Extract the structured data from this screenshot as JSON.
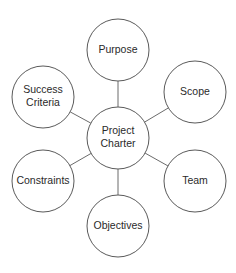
{
  "diagram": {
    "type": "hub-and-spoke",
    "center": {
      "id": "project-charter",
      "label_lines": [
        "Project",
        "Charter"
      ],
      "cx": 118,
      "cy": 138,
      "r": 31
    },
    "nodes": [
      {
        "id": "purpose",
        "label_lines": [
          "Purpose"
        ],
        "cx": 118,
        "cy": 50,
        "r": 31
      },
      {
        "id": "scope",
        "label_lines": [
          "Scope"
        ],
        "cx": 195,
        "cy": 92,
        "r": 31
      },
      {
        "id": "team",
        "label_lines": [
          "Team"
        ],
        "cx": 195,
        "cy": 181,
        "r": 31
      },
      {
        "id": "objectives",
        "label_lines": [
          "Objectives"
        ],
        "cx": 118,
        "cy": 226,
        "r": 31
      },
      {
        "id": "constraints",
        "label_lines": [
          "Constraints"
        ],
        "cx": 43,
        "cy": 181,
        "r": 31
      },
      {
        "id": "success-criteria",
        "label_lines": [
          "Success",
          "Criteria"
        ],
        "cx": 43,
        "cy": 97,
        "r": 31
      }
    ],
    "colors": {
      "background": "#ffffff",
      "stroke": "#5a5a5a",
      "text": "#2a2a2a"
    }
  }
}
